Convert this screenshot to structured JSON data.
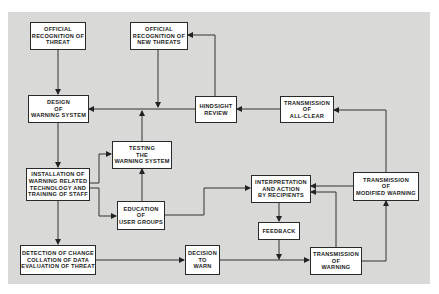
{
  "diagram": {
    "colors": {
      "panel": "#d9d9d7",
      "box_fill": "#ffffff",
      "line": "#333333"
    },
    "nodes": [
      {
        "id": "official-recognition-threat",
        "label": "OFFICIAL\nRECOGNITION OF\nTHREAT"
      },
      {
        "id": "official-recognition-new-threats",
        "label": "OFFICIAL\nRECOGNITION OF\nNEW THREATS"
      },
      {
        "id": "design-warning-system",
        "label": "DESIGN\nOF\nWARNING SYSTEM"
      },
      {
        "id": "hindsight-review",
        "label": "HINDSIGHT\nREVIEW"
      },
      {
        "id": "transmission-all-clear",
        "label": "TRANSMISSION\nOF\nALL-CLEAR"
      },
      {
        "id": "testing-warning-system",
        "label": "TESTING\nTHE\nWARNING SYSTEM"
      },
      {
        "id": "installation",
        "label": "INSTALLATION OF\nWARNING RELATED\nTECHNOLOGY  AND\nTRAINING OF STAFF"
      },
      {
        "id": "education-user-groups",
        "label": "EDUCATION\nOF\nUSER GROUPS"
      },
      {
        "id": "interpretation-action",
        "label": "INTERPRETATION\nAND ACTION\nBY RECIPIENTS"
      },
      {
        "id": "transmission-modified-warning",
        "label": "TRANSMISSION\nOF\nMODIFIED WARNING"
      },
      {
        "id": "feedback",
        "label": "FEEDBACK"
      },
      {
        "id": "detection-change",
        "label": "DETECTION OF CHANGE\nCOLLATION OF DATA\nEVALUATION OF THREAT"
      },
      {
        "id": "decision-to-warn",
        "label": "DECISION\nTO\nWARN"
      },
      {
        "id": "transmission-warning",
        "label": "TRANSMISSION\nOF\nWARNING"
      }
    ],
    "edges": [
      {
        "from": "official-recognition-threat",
        "to": "design-warning-system"
      },
      {
        "from": "official-recognition-new-threats",
        "to": "design-warning-system"
      },
      {
        "from": "hindsight-review",
        "to": "official-recognition-new-threats"
      },
      {
        "from": "hindsight-review",
        "to": "design-warning-system"
      },
      {
        "from": "transmission-all-clear",
        "to": "hindsight-review"
      },
      {
        "from": "design-warning-system",
        "to": "installation"
      },
      {
        "from": "installation",
        "to": "testing-warning-system"
      },
      {
        "from": "installation",
        "to": "education-user-groups"
      },
      {
        "from": "installation",
        "to": "detection-change"
      },
      {
        "from": "testing-warning-system",
        "to": "design-warning-system"
      },
      {
        "from": "education-user-groups",
        "to": "testing-warning-system"
      },
      {
        "from": "education-user-groups",
        "to": "interpretation-action"
      },
      {
        "from": "interpretation-action",
        "to": "feedback"
      },
      {
        "from": "feedback",
        "to": "transmission-warning"
      },
      {
        "from": "detection-change",
        "to": "decision-to-warn"
      },
      {
        "from": "decision-to-warn",
        "to": "transmission-warning"
      },
      {
        "from": "transmission-warning",
        "to": "interpretation-action"
      },
      {
        "from": "transmission-warning",
        "to": "transmission-modified-warning"
      },
      {
        "from": "transmission-modified-warning",
        "to": "interpretation-action"
      },
      {
        "from": "transmission-modified-warning",
        "to": "transmission-all-clear"
      }
    ]
  }
}
